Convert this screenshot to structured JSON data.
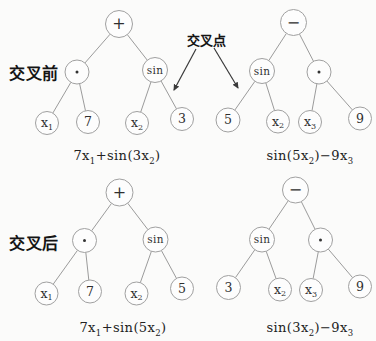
{
  "figure": {
    "width": 376,
    "height": 341
  },
  "colors": {
    "background": "#fbfbfa",
    "node_fill": "#fdfdfd",
    "node_stroke": "#a0a0a0",
    "edge_stroke": "#9b9b9b",
    "node_text": "#2f2f2f",
    "dot_fill": "#333333",
    "arrow": "#3a3a3a"
  },
  "labels": {
    "before": "交叉前",
    "after": "交叉后",
    "crossover_point": "交叉点"
  },
  "crossover_arrows": [
    {
      "x1": 196,
      "y1": 49,
      "x2": 174,
      "y2": 90
    },
    {
      "x1": 214,
      "y1": 48,
      "x2": 238,
      "y2": 88
    }
  ],
  "trees": [
    {
      "id": "before-left",
      "nodes": [
        {
          "id": "plus",
          "label": "+",
          "x": 119,
          "y": 24,
          "r": 13.5
        },
        {
          "id": "dot",
          "label": "·",
          "x": 77,
          "y": 72,
          "r": 12
        },
        {
          "id": "sin",
          "label": "sin",
          "x": 155,
          "y": 70,
          "r": 12.5
        },
        {
          "id": "x1",
          "label": "x₁",
          "x": 47,
          "y": 123,
          "r": 11.5
        },
        {
          "id": "n7",
          "label": "7",
          "x": 88,
          "y": 122,
          "r": 11.5
        },
        {
          "id": "x2",
          "label": "x₂",
          "x": 137,
          "y": 123,
          "r": 11.5
        },
        {
          "id": "n3",
          "label": "3",
          "x": 182,
          "y": 119,
          "r": 11.5
        }
      ],
      "edges": [
        [
          "plus",
          "dot"
        ],
        [
          "plus",
          "sin"
        ],
        [
          "dot",
          "x1"
        ],
        [
          "dot",
          "n7"
        ],
        [
          "sin",
          "x2"
        ],
        [
          "sin",
          "n3"
        ]
      ],
      "formula": {
        "text": "7x₁+sin(3x₂)",
        "x": 117,
        "y": 148
      }
    },
    {
      "id": "before-right",
      "nodes": [
        {
          "id": "minus",
          "label": "−",
          "x": 293.5,
          "y": 22.5,
          "r": 13
        },
        {
          "id": "sin",
          "label": "sin",
          "x": 262,
          "y": 71,
          "r": 12.5
        },
        {
          "id": "dot",
          "label": "·",
          "x": 319,
          "y": 72,
          "r": 12
        },
        {
          "id": "n5",
          "label": "5",
          "x": 228,
          "y": 120,
          "r": 12
        },
        {
          "id": "x2",
          "label": "x₂",
          "x": 278,
          "y": 121.5,
          "r": 11.5
        },
        {
          "id": "x3",
          "label": "x₃",
          "x": 310,
          "y": 122,
          "r": 11.5
        },
        {
          "id": "n9",
          "label": "9",
          "x": 360,
          "y": 118.5,
          "r": 11.5
        }
      ],
      "edges": [
        [
          "minus",
          "sin"
        ],
        [
          "minus",
          "dot"
        ],
        [
          "sin",
          "n5"
        ],
        [
          "sin",
          "x2"
        ],
        [
          "dot",
          "x3"
        ],
        [
          "dot",
          "n9"
        ]
      ],
      "formula": {
        "text": "sin(5x₂)−9x₃",
        "x": 310,
        "y": 148
      }
    },
    {
      "id": "after-left",
      "nodes": [
        {
          "id": "plus",
          "label": "+",
          "x": 119.5,
          "y": 192.5,
          "r": 13.5
        },
        {
          "id": "dot",
          "label": "·",
          "x": 84.5,
          "y": 240.5,
          "r": 12
        },
        {
          "id": "sin",
          "label": "sin",
          "x": 155.5,
          "y": 239.5,
          "r": 12.5
        },
        {
          "id": "x1",
          "label": "x₁",
          "x": 46.5,
          "y": 293.5,
          "r": 11.5
        },
        {
          "id": "n7",
          "label": "7",
          "x": 90,
          "y": 291.5,
          "r": 11.5
        },
        {
          "id": "x2",
          "label": "x₂",
          "x": 136.5,
          "y": 293.5,
          "r": 11.5
        },
        {
          "id": "n5",
          "label": "5",
          "x": 182,
          "y": 288.5,
          "r": 11.5
        }
      ],
      "edges": [
        [
          "plus",
          "dot"
        ],
        [
          "plus",
          "sin"
        ],
        [
          "dot",
          "x1"
        ],
        [
          "dot",
          "n7"
        ],
        [
          "sin",
          "x2"
        ],
        [
          "sin",
          "n5"
        ]
      ],
      "formula": {
        "text": "7x₁+sin(5x₂)",
        "x": 123,
        "y": 320
      }
    },
    {
      "id": "after-right",
      "nodes": [
        {
          "id": "minus",
          "label": "−",
          "x": 295.5,
          "y": 190,
          "r": 13
        },
        {
          "id": "sin",
          "label": "sin",
          "x": 262,
          "y": 239.5,
          "r": 12.5
        },
        {
          "id": "dot",
          "label": "·",
          "x": 320.5,
          "y": 240,
          "r": 12
        },
        {
          "id": "n3",
          "label": "3",
          "x": 228.5,
          "y": 287.5,
          "r": 12
        },
        {
          "id": "x2",
          "label": "x₂",
          "x": 280,
          "y": 289.5,
          "r": 11.5
        },
        {
          "id": "x3",
          "label": "x₃",
          "x": 311,
          "y": 290,
          "r": 11.5
        },
        {
          "id": "n9",
          "label": "9",
          "x": 360,
          "y": 286.5,
          "r": 11.5
        }
      ],
      "edges": [
        [
          "minus",
          "sin"
        ],
        [
          "minus",
          "dot"
        ],
        [
          "sin",
          "n3"
        ],
        [
          "sin",
          "x2"
        ],
        [
          "dot",
          "x3"
        ],
        [
          "dot",
          "n9"
        ]
      ],
      "formula": {
        "text": "sin(3x₂)−9x₃",
        "x": 310,
        "y": 320
      }
    }
  ]
}
